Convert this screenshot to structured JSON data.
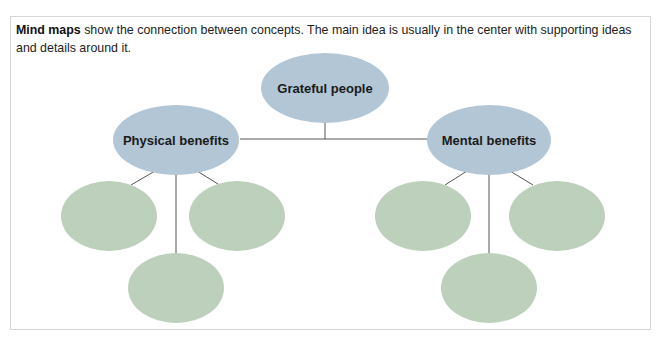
{
  "intro": {
    "term": "Mind maps",
    "text": " show the connection between concepts. The main idea is usually in the center with supporting ideas and details around it."
  },
  "diagram": {
    "colors": {
      "main_node": "#b2c6d6",
      "detail_node": "#bcd0bc",
      "connector": "#555555"
    },
    "main_idea": {
      "label": "Grateful people"
    },
    "branches": [
      {
        "label": "Physical benefits",
        "details": [
          "",
          "",
          ""
        ]
      },
      {
        "label": "Mental benefits",
        "details": [
          "",
          "",
          ""
        ]
      }
    ]
  }
}
